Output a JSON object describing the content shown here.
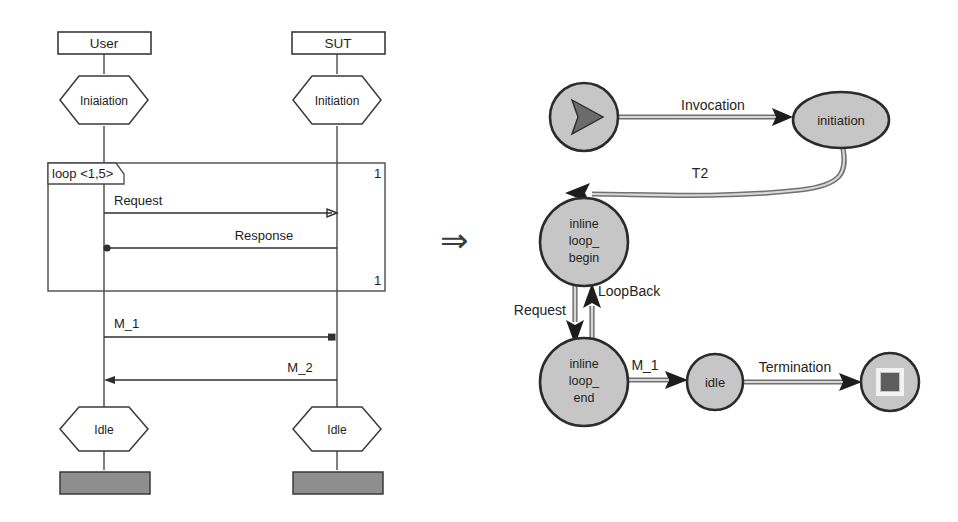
{
  "figure": {
    "transform_arrow": "⇒"
  },
  "sequence_diagram": {
    "lifelines": [
      {
        "name": "User",
        "label": "User"
      },
      {
        "name": "SUT",
        "label": "SUT"
      }
    ],
    "states_top": [
      {
        "label": "Iniaiation"
      },
      {
        "label": "Initiation"
      }
    ],
    "states_bottom": [
      {
        "label": "Idle"
      },
      {
        "label": "Idle"
      }
    ],
    "loop_fragment": {
      "operator_label": "loop <1,5>",
      "multiplicity_top": "1",
      "multiplicity_bottom": "1",
      "messages": [
        {
          "label": "Request",
          "from": "User",
          "to": "SUT",
          "direction": "right"
        },
        {
          "label": "Response",
          "from": "SUT",
          "to": "User",
          "direction": "left"
        }
      ]
    },
    "messages_after_loop": [
      {
        "label": "M_1",
        "from": "User",
        "to": "SUT",
        "direction": "right"
      },
      {
        "label": "M_2",
        "from": "SUT",
        "to": "User",
        "direction": "left"
      }
    ]
  },
  "state_machine": {
    "nodes": [
      {
        "id": "start",
        "label": "",
        "icon": "play-triangle-icon",
        "shape": "circle"
      },
      {
        "id": "initiation",
        "label": "initiation",
        "shape": "ellipse"
      },
      {
        "id": "inline_loop_begin",
        "label": "inline\nloop_\nbegin",
        "lines": [
          "inline",
          "loop_",
          "begin"
        ],
        "shape": "circle"
      },
      {
        "id": "inline_loop_end",
        "label": "inline\nloop_\nend",
        "lines": [
          "inline",
          "loop_",
          "end"
        ],
        "shape": "circle"
      },
      {
        "id": "idle",
        "label": "idle",
        "shape": "circle"
      },
      {
        "id": "final",
        "label": "",
        "icon": "stop-square-icon",
        "shape": "circle"
      }
    ],
    "transitions": [
      {
        "label": "Invocation",
        "from": "start",
        "to": "initiation"
      },
      {
        "label": "T2",
        "from": "initiation",
        "to": "inline_loop_begin"
      },
      {
        "label": "Request",
        "from": "inline_loop_begin",
        "to": "inline_loop_end"
      },
      {
        "label": "LoopBack",
        "from": "inline_loop_end",
        "to": "inline_loop_begin"
      },
      {
        "label": "M_1",
        "from": "inline_loop_end",
        "to": "idle"
      },
      {
        "label": "Termination",
        "from": "idle",
        "to": "final"
      }
    ]
  },
  "colors": {
    "node_fill": "#c6c6c6",
    "node_stroke": "#2b2b2b",
    "edge_outer": "#707070",
    "edge_inner": "#d8d8d8",
    "terminator_bar": "#8e8e8e",
    "background": "#ffffff",
    "text": "#1c1c1c"
  }
}
